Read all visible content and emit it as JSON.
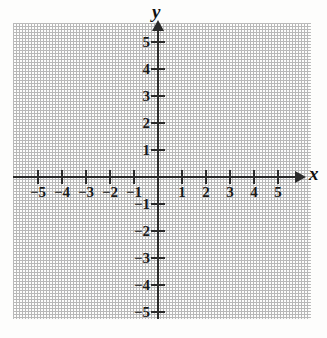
{
  "figure": {
    "type": "cartesian-coordinate-plane",
    "background_color": "#fdfdfc",
    "axis_color": "#2b2b2b",
    "grid_color": "#bcbcbc"
  },
  "axes": {
    "x": {
      "name": "x",
      "min": -5,
      "max": 5,
      "tick_labels": [
        "−5",
        "−4",
        "−3",
        "−2",
        "−1",
        "1",
        "2",
        "3",
        "4",
        "5"
      ],
      "tick_values": [
        -5,
        -4,
        -3,
        -2,
        -1,
        1,
        2,
        3,
        4,
        5
      ],
      "arrow": "right"
    },
    "y": {
      "name": "y",
      "min": -5,
      "max": 5,
      "tick_labels": [
        "5",
        "4",
        "3",
        "2",
        "1",
        "−1",
        "−2",
        "−3",
        "−4",
        "−5"
      ],
      "tick_values": [
        5,
        4,
        3,
        2,
        1,
        -1,
        -2,
        -3,
        -4,
        -5
      ],
      "arrow": "up"
    }
  },
  "chart_data": {
    "type": "scatter",
    "title": "",
    "xlabel": "x",
    "ylabel": "y",
    "xlim": [
      -5,
      5
    ],
    "ylim": [
      -5,
      5
    ],
    "grid": true,
    "legend": null,
    "series": [],
    "annotations": []
  }
}
